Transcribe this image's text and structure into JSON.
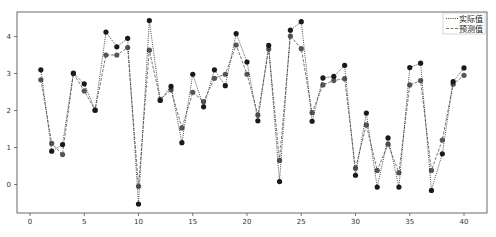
{
  "chart_data": {
    "type": "line",
    "title": "",
    "xlabel": "",
    "ylabel": "",
    "xlim": [
      -1.2,
      42.1
    ],
    "ylim": [
      -0.77,
      4.68
    ],
    "grid": false,
    "legend_position": "upper right",
    "x_ticks": [
      0,
      5,
      10,
      15,
      20,
      25,
      30,
      35,
      40
    ],
    "y_ticks": [
      0,
      1,
      2,
      3,
      4
    ],
    "x": [
      1,
      2,
      3,
      4,
      5,
      6,
      7,
      8,
      9,
      10,
      11,
      12,
      13,
      14,
      15,
      16,
      17,
      18,
      19,
      20,
      21,
      22,
      23,
      24,
      25,
      26,
      27,
      28,
      29,
      30,
      31,
      32,
      33,
      34,
      35,
      36,
      37,
      38,
      39,
      40
    ],
    "series": [
      {
        "name": "实际值",
        "line_style": "dotted",
        "color": "#1a1a1a",
        "marker": "circle",
        "values": [
          3.1,
          0.9,
          1.08,
          3.01,
          2.72,
          2.01,
          4.12,
          3.72,
          3.95,
          -0.53,
          4.43,
          2.27,
          2.65,
          1.13,
          2.98,
          2.1,
          3.1,
          2.67,
          4.08,
          3.31,
          1.72,
          3.76,
          0.08,
          4.17,
          4.4,
          1.71,
          2.88,
          2.92,
          3.22,
          0.25,
          1.93,
          -0.07,
          1.26,
          -0.07,
          3.16,
          3.28,
          -0.16,
          0.83,
          2.78,
          3.15
        ]
      },
      {
        "name": "预测值",
        "line_style": "dashed",
        "color": "#555555",
        "marker": "circle",
        "values": [
          2.83,
          1.11,
          0.81,
          3.0,
          2.53,
          2.01,
          3.5,
          3.5,
          3.7,
          -0.05,
          3.63,
          2.3,
          2.56,
          1.53,
          2.49,
          2.24,
          2.87,
          2.98,
          3.77,
          2.98,
          1.88,
          3.66,
          0.65,
          4.01,
          3.67,
          1.94,
          2.69,
          2.81,
          2.86,
          0.44,
          1.61,
          0.38,
          1.09,
          0.32,
          2.69,
          2.81,
          0.38,
          1.2,
          2.71,
          2.95
        ]
      }
    ]
  },
  "legend": {
    "items": [
      {
        "label": "实际值",
        "style": "dotted"
      },
      {
        "label": "预测值",
        "style": "dashed"
      }
    ]
  }
}
